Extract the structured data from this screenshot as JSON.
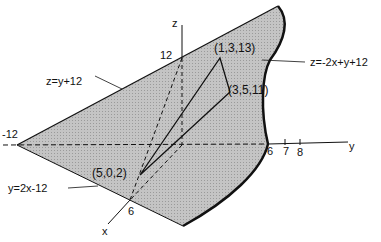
{
  "diagram": {
    "axes": {
      "x_label": "x",
      "y_label": "y",
      "z_label": "z"
    },
    "ticks": {
      "z_12": "12",
      "y_neg12": "-12",
      "y_6": "6",
      "y_7": "7",
      "y_8": "8",
      "x_6": "6"
    },
    "planes": {
      "top_edge": "z=y+12",
      "surface": "z=-2x+y+12",
      "base_edge": "y=2x-12"
    },
    "points": {
      "p1": "(1,3,13)",
      "p2": "(3,5,11)",
      "p3": "(5,0,2)"
    },
    "colors": {
      "fill": "#bdbdbd",
      "line": "#111111"
    }
  }
}
